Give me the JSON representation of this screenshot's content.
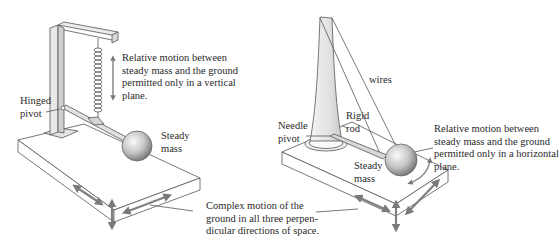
{
  "left_diagram": {
    "motion_label": [
      "Relative motion between",
      "steady mass and the ground",
      "permitted only in a vertical",
      "plane."
    ],
    "pivot_label": [
      "Hinged",
      "pivot"
    ],
    "mass_label": [
      "Steady",
      "mass"
    ]
  },
  "right_diagram": {
    "wires_label": "wires",
    "rod_label": [
      "Rigid",
      "rod"
    ],
    "pivot_label": [
      "Needle",
      "pivot"
    ],
    "mass_label": [
      "Steady",
      "mass"
    ],
    "motion_label": [
      "Relative motion between",
      "steady mass and the ground",
      "permitted only in a horizontal",
      "plane."
    ]
  },
  "ground_label": [
    "Complex motion of the",
    "ground in all three perpen-",
    "dicular directions of space."
  ],
  "colors": {
    "line": "#555555",
    "arrow": "#808080",
    "mass_light": "#f4f4f4",
    "mass_dark": "#8a8a8a",
    "frame_fill": "#e6e6e6"
  }
}
